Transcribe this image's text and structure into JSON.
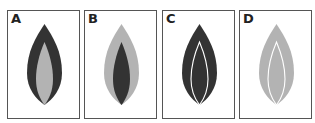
{
  "figure": {
    "panels": [
      {
        "label": "A",
        "outer": "dark",
        "inner": "light",
        "inner_style": "filled"
      },
      {
        "label": "B",
        "outer": "light",
        "inner": "dark",
        "inner_style": "filled"
      },
      {
        "label": "C",
        "outer": "dark",
        "inner": "dark",
        "inner_style": "white-outline"
      },
      {
        "label": "D",
        "outer": "light",
        "inner": "light",
        "inner_style": "white-outline"
      }
    ],
    "colors": {
      "dark": "#333333",
      "light": "#b3b3b3",
      "outline": "#ffffff",
      "border": "#555555"
    }
  }
}
